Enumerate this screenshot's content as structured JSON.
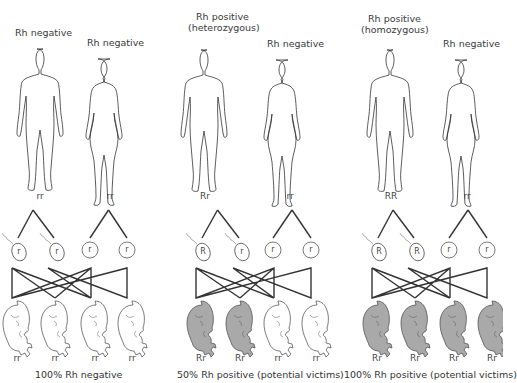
{
  "panels": [
    {
      "father_label": "Rh negative",
      "father_label2": "",
      "mother_label": "Rh negative",
      "father_genotype": "rr",
      "mother_genotype": "rr",
      "sperm": [
        "r",
        "r"
      ],
      "eggs": [
        "r",
        "r"
      ],
      "offspring": [
        "rr",
        "rr",
        "rr",
        "rr"
      ],
      "offspring_positive": [
        false,
        false,
        false,
        false
      ],
      "caption": "100% Rh negative"
    },
    {
      "father_label": "Rh positive",
      "father_label2": "(heterozygous)",
      "mother_label": "Rh negative",
      "father_genotype": "Rr",
      "mother_genotype": "rr",
      "sperm": [
        "R",
        "r"
      ],
      "eggs": [
        "r",
        "r"
      ],
      "offspring": [
        "Rr",
        "Rr",
        "rr",
        "rr"
      ],
      "offspring_positive": [
        true,
        true,
        false,
        false
      ],
      "caption": "50% Rh positive (potential victims)"
    },
    {
      "father_label": "Rh positive",
      "father_label2": "(homozygous)",
      "mother_label": "Rh negative",
      "father_genotype": "RR",
      "mother_genotype": "rr",
      "sperm": [
        "R",
        "R"
      ],
      "eggs": [
        "r",
        "r"
      ],
      "offspring": [
        "Rr",
        "Rr",
        "Rr",
        "Rr"
      ],
      "offspring_positive": [
        true,
        true,
        true,
        true
      ],
      "caption": "100% Rh positive (potential victims)"
    }
  ],
  "colors": {
    "positive_fill": "#a9a9a9",
    "negative_fill": "#ffffff",
    "line": "#333333"
  }
}
